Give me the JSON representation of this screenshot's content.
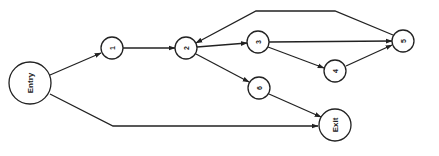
{
  "diagram": {
    "type": "control-flow-graph",
    "colors": {
      "stroke": "#222222",
      "background": "#ffffff"
    },
    "nodes": [
      {
        "id": "entry",
        "label": "Entry",
        "cx": 30,
        "cy": 83,
        "r": 21,
        "font_size": 8
      },
      {
        "id": "n1",
        "label": "1",
        "cx": 112,
        "cy": 48,
        "r": 11,
        "font_size": 7
      },
      {
        "id": "n2",
        "label": "2",
        "cx": 186,
        "cy": 48,
        "r": 11,
        "font_size": 7
      },
      {
        "id": "n3",
        "label": "3",
        "cx": 258,
        "cy": 42,
        "r": 11,
        "font_size": 7
      },
      {
        "id": "n4",
        "label": "4",
        "cx": 335,
        "cy": 71,
        "r": 11,
        "font_size": 7
      },
      {
        "id": "n5",
        "label": "5",
        "cx": 403,
        "cy": 41,
        "r": 11,
        "font_size": 7
      },
      {
        "id": "n6",
        "label": "6",
        "cx": 259,
        "cy": 88,
        "r": 11,
        "font_size": 7
      },
      {
        "id": "exit",
        "label": "Exit",
        "cx": 335,
        "cy": 125,
        "r": 16,
        "font_size": 8
      }
    ],
    "edges": [
      {
        "from": "entry",
        "to": "n1",
        "points": "50,75 101,53"
      },
      {
        "from": "n1",
        "to": "n2",
        "points": "123,48 175,48"
      },
      {
        "from": "n2",
        "to": "n3",
        "points": "197,47 247,43"
      },
      {
        "from": "n2",
        "to": "n6",
        "points": "196,54 249,82"
      },
      {
        "from": "n3",
        "to": "n5",
        "points": "269,42 392,41"
      },
      {
        "from": "n3",
        "to": "n4",
        "points": "268,47 324,68"
      },
      {
        "from": "n4",
        "to": "n5",
        "points": "346,66 392,45"
      },
      {
        "from": "n5",
        "to": "n2",
        "points": "393,35 335,11 256,11 196,43"
      },
      {
        "from": "n6",
        "to": "exit",
        "points": "269,94 321,117"
      },
      {
        "from": "entry",
        "to": "exit",
        "points": "50,94 113,126 318,126"
      }
    ]
  }
}
